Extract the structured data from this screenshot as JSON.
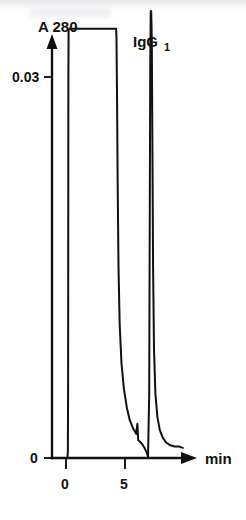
{
  "figure": {
    "title": "",
    "background_color": "#ffffff",
    "ink_color": "#111111"
  },
  "labels": {
    "y_axis_title": "A 280",
    "x_axis_title": "min",
    "y_tick_upper": "0.03",
    "y_tick_lower": "0",
    "x_tick_first": "0",
    "x_tick_second": "5",
    "peak_label_main": "IgG",
    "peak_label_sub": "1"
  },
  "chart_data": {
    "type": "line",
    "title": "",
    "subtitle": "",
    "xlabel": "min",
    "ylabel": "A 280",
    "xlim": [
      -0.5,
      11.0
    ],
    "ylim": [
      0,
      0.0385
    ],
    "grid": false,
    "legend": null,
    "x_ticks": [
      0,
      5
    ],
    "x_tick_labels": [
      "0",
      "5"
    ],
    "y_ticks": [
      0,
      0.03
    ],
    "y_tick_labels": [
      "0",
      "0.03"
    ],
    "annotations": [
      {
        "text": "IgG1",
        "x": 7.4,
        "y": 0.0355,
        "note": "label above sharp second peak"
      }
    ],
    "series": [
      {
        "name": "A 280 absorbance trace",
        "points": [
          [
            -0.15,
            0.0
          ],
          [
            0.12,
            0.0
          ],
          [
            0.16,
            0.0006
          ],
          [
            0.18,
            0.0065
          ],
          [
            0.19,
            0.0185
          ],
          [
            0.2,
            0.0295
          ],
          [
            0.22,
            0.0337
          ],
          [
            0.3,
            0.0338
          ],
          [
            1.0,
            0.0338
          ],
          [
            2.0,
            0.0338
          ],
          [
            3.0,
            0.0338
          ],
          [
            4.0,
            0.0338
          ],
          [
            4.25,
            0.0338
          ],
          [
            4.28,
            0.033
          ],
          [
            4.32,
            0.029
          ],
          [
            4.38,
            0.0215
          ],
          [
            4.45,
            0.015
          ],
          [
            4.55,
            0.0105
          ],
          [
            4.7,
            0.0075
          ],
          [
            4.9,
            0.0055
          ],
          [
            5.15,
            0.004
          ],
          [
            5.4,
            0.003
          ],
          [
            5.7,
            0.0023
          ],
          [
            5.95,
            0.0019
          ],
          [
            6.05,
            0.0027
          ],
          [
            6.12,
            0.0014
          ],
          [
            6.25,
            0.0013
          ],
          [
            6.45,
            0.0011
          ],
          [
            6.65,
            0.0008
          ],
          [
            6.85,
            0.0004
          ],
          [
            6.95,
            0.0001
          ],
          [
            7.05,
            0.005
          ],
          [
            7.1,
            0.019
          ],
          [
            7.14,
            0.031
          ],
          [
            7.18,
            0.0352
          ],
          [
            7.22,
            0.0352
          ],
          [
            7.27,
            0.033
          ],
          [
            7.32,
            0.025
          ],
          [
            7.38,
            0.015
          ],
          [
            7.46,
            0.0085
          ],
          [
            7.58,
            0.005
          ],
          [
            7.75,
            0.0032
          ],
          [
            7.95,
            0.0022
          ],
          [
            8.2,
            0.0016
          ],
          [
            8.5,
            0.0012
          ],
          [
            8.85,
            0.001
          ],
          [
            9.2,
            0.0009
          ],
          [
            9.6,
            0.0009
          ],
          [
            9.9,
            0.0008
          ]
        ],
        "features": [
          {
            "kind": "plateau",
            "label": "saturated flow-through peak",
            "from_x": 0.25,
            "to_x": 4.25,
            "level": 0.0338
          },
          {
            "kind": "shoulder",
            "label": "small tail shoulder",
            "x": 6.05,
            "y": 0.0027
          },
          {
            "kind": "sharp_peak",
            "label": "IgG1",
            "x": 7.2,
            "y": 0.0352
          }
        ]
      }
    ]
  }
}
